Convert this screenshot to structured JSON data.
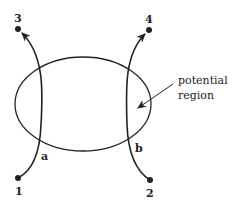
{
  "diagram": {
    "type": "scattering-trajectories",
    "stroke_color": "#222222",
    "background": "#ffffff",
    "region": {
      "label_line1": "potential",
      "label_line2": "region",
      "shape": "ellipse",
      "cx": 83,
      "cy": 104,
      "rx": 68,
      "ry": 47
    },
    "points": [
      {
        "id": "1",
        "label": "1",
        "x": 18,
        "y": 178
      },
      {
        "id": "2",
        "label": "2",
        "x": 150,
        "y": 180
      },
      {
        "id": "3",
        "label": "3",
        "x": 18,
        "y": 29
      },
      {
        "id": "4",
        "label": "4",
        "x": 149,
        "y": 30
      }
    ],
    "paths": [
      {
        "id": "a",
        "label": "a",
        "from": "1",
        "to": "3"
      },
      {
        "id": "b",
        "label": "b",
        "from": "2",
        "to": "4"
      }
    ]
  }
}
